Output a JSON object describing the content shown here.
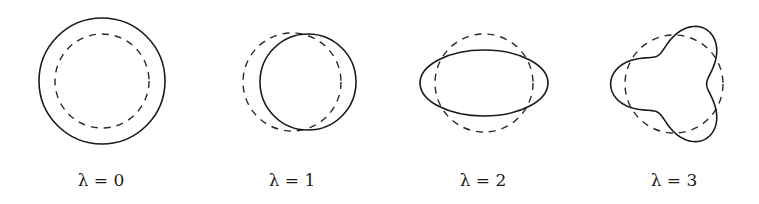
{
  "figure": {
    "panels": [
      {
        "label": "λ = 0",
        "mode": 0,
        "cx": 102,
        "cy": 81,
        "ref_r": 47,
        "solid": {
          "type": "circle",
          "r": 63
        }
      },
      {
        "label": "λ = 1",
        "mode": 1,
        "cx": 292,
        "cy": 82,
        "ref_r": 49,
        "solid": {
          "type": "circle",
          "r": 48,
          "dx": 16
        }
      },
      {
        "label": "λ = 2",
        "mode": 2,
        "cx": 484,
        "cy": 83,
        "ref_r": 49,
        "solid": {
          "type": "ellipse",
          "rx": 64,
          "ry": 33
        }
      },
      {
        "label": "λ = 3",
        "mode": 3,
        "cx": 674,
        "cy": 84,
        "ref_r": 49,
        "solid": {
          "type": "trefoil",
          "R": 48,
          "eps": 0.32
        }
      }
    ]
  }
}
